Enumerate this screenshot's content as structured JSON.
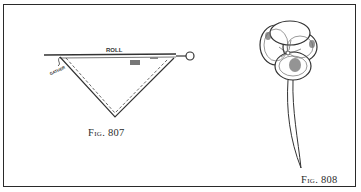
{
  "figures": [
    {
      "id": "fig-807",
      "caption": "Fig. 807",
      "labels": {
        "roll": "ROLL",
        "gather": "GATHER"
      }
    },
    {
      "id": "fig-808",
      "caption": "Fig. 808"
    }
  ],
  "colors": {
    "ink": "#2a2a2a",
    "paper": "#ffffff"
  }
}
